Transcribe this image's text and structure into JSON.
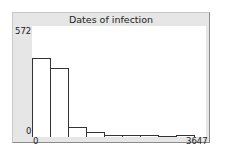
{
  "chart_data": {
    "type": "bar",
    "title": "Dates of infection",
    "xlabel": "",
    "ylabel": "",
    "xlim": [
      0,
      3647
    ],
    "ylim": [
      0,
      572
    ],
    "x_tick_labels": [
      "0",
      "3647"
    ],
    "y_tick_labels": [
      "0",
      "572"
    ],
    "grid": false,
    "legend": null,
    "bins": 9,
    "values": [
      405,
      356,
      49,
      27,
      11,
      8,
      11,
      5,
      8
    ]
  },
  "labels": {
    "title": "Dates of infection",
    "y_max": "572",
    "y_min": "0",
    "x_min": "0",
    "x_max": "3647"
  },
  "colors": {
    "panel_bg": "#e6e6e6",
    "plot_bg": "#ffffff",
    "bar_fill": "#ffffff",
    "bar_stroke": "#333333"
  }
}
